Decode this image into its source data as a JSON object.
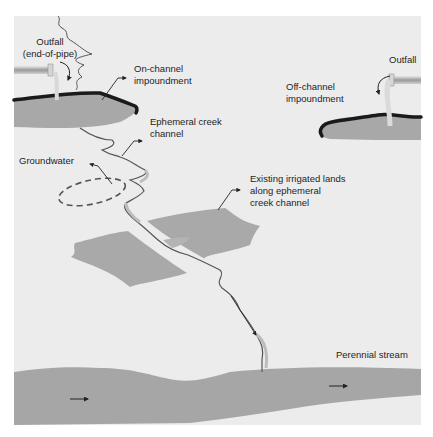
{
  "diagram": {
    "type": "schematic illustration",
    "colors": {
      "panel": "#ececec",
      "water": "#a6a6a6",
      "land": "#a9a9a9",
      "shoreline": "#1a1a1a",
      "creek_line": "#555555",
      "arrow": "#222222",
      "pipe": "#b5b5b5"
    },
    "labels": {
      "outfall_left": "Outfall\n(end-of-pipe)",
      "on_channel": "On-channel\nimpoundment",
      "ephemeral": "Ephemeral creek\nchannel",
      "groundwater": "Groundwater",
      "irrigated": "Existing irrigated lands\nalong ephemeral\ncreek channel",
      "outfall_right": "Outfall",
      "off_channel": "Off-channel\nimpoundment",
      "perennial": "Perennial stream"
    },
    "icons": [
      "pipe-icon-left",
      "pipe-icon-right",
      "curved-arrow-icon-left",
      "curved-arrow-icon-right",
      "flow-arrow-icon-downstream",
      "flow-arrow-icon-stream-left",
      "flow-arrow-icon-stream-right"
    ]
  }
}
